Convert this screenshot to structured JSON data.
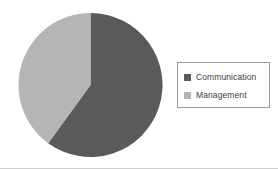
{
  "chart_data": {
    "type": "pie",
    "title": "",
    "labels": [
      "Communication",
      "Management"
    ],
    "values": [
      60,
      40
    ],
    "colors": [
      "#5a5a5a",
      "#b5b5b5"
    ],
    "start_angle_deg": 0,
    "direction": "clockwise",
    "legend_position": "right",
    "grid": false,
    "slices": [
      {
        "label": "Communication",
        "value": 60,
        "percent": 60,
        "color": "#5a5a5a",
        "start_deg": 0,
        "end_deg": 216
      },
      {
        "label": "Management",
        "value": 40,
        "percent": 40,
        "color": "#b5b5b5",
        "start_deg": 216,
        "end_deg": 360
      }
    ]
  },
  "legend": {
    "items": [
      {
        "label": "Communication",
        "swatch_color": "#5a5a5a"
      },
      {
        "label": "Management",
        "swatch_color": "#b5b5b5"
      }
    ]
  },
  "figure": {
    "background": "#ffffff",
    "border_color": "#9a9a9a"
  }
}
